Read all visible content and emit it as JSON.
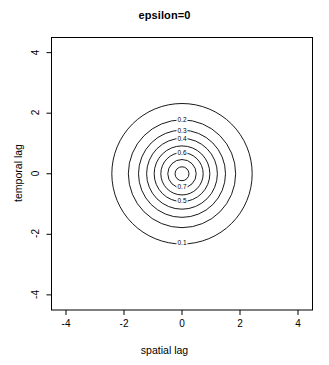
{
  "chart_data": {
    "type": "contour",
    "title": "epsilon=0",
    "xlabel": "spatial lag",
    "ylabel": "temporal lag",
    "xlim": [
      -4.5,
      4.5
    ],
    "ylim": [
      -4.5,
      4.5
    ],
    "xticks": [
      "-4",
      "-2",
      "0",
      "2",
      "4"
    ],
    "xtick_values": [
      -4,
      -2,
      0,
      2,
      4
    ],
    "yticks": [
      "-4",
      "-2",
      "0",
      "2",
      "4"
    ],
    "ytick_values": [
      -4,
      -2,
      0,
      2,
      4
    ],
    "grid": false,
    "legend": "none",
    "box": true,
    "center": [
      0,
      0
    ],
    "levels": [
      0.1,
      0.2,
      0.3,
      0.4,
      0.5,
      0.6,
      0.7,
      0.8
    ],
    "contours": [
      {
        "level": "0.1",
        "rx": 2.42,
        "ry": 2.32,
        "label_x": 0.0,
        "label_y": -2.3
      },
      {
        "level": "0.2",
        "rx": 1.85,
        "ry": 1.78,
        "label_x": 0.0,
        "label_y": 1.76
      },
      {
        "level": "0.3",
        "rx": 1.5,
        "ry": 1.44,
        "label_x": 0.0,
        "label_y": 1.42
      },
      {
        "level": "0.4",
        "rx": 1.22,
        "ry": 1.17,
        "label_x": 0.0,
        "label_y": 1.14
      },
      {
        "level": "0.5",
        "rx": 0.96,
        "ry": 0.92,
        "label_x": 0.0,
        "label_y": -0.89
      },
      {
        "level": "0.6",
        "rx": 0.73,
        "ry": 0.7,
        "label_x": 0.0,
        "label_y": 0.67
      },
      {
        "level": "0.7",
        "rx": 0.49,
        "ry": 0.47,
        "label_x": 0.0,
        "label_y": -0.45
      },
      {
        "level": "0.8",
        "rx": 0.24,
        "ry": 0.23,
        "label_x": null,
        "label_y": null
      }
    ],
    "line_color": "#000000",
    "axis_color": "#000000",
    "background": "#ffffff"
  }
}
